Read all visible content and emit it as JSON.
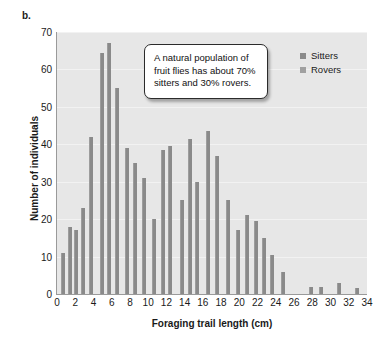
{
  "panel": {
    "label": "b."
  },
  "callout": {
    "text": "A natural population of fruit flies has about 70% sitters and 30% rovers."
  },
  "legend": {
    "position": "top-right",
    "entries": [
      {
        "label": "Sitters",
        "color": "#8a8a8a"
      },
      {
        "label": "Rovers",
        "color": "#a0a0a0"
      }
    ]
  },
  "colors": {
    "bar": "#8a8a8a",
    "plot_background": "#e7e7e7",
    "gridline": "#f2f2f2",
    "axis": "#9a9a9a",
    "text": "#1a1a1a"
  },
  "chart_data": {
    "type": "bar",
    "title": "",
    "subtitle": "",
    "xlabel": "Foraging trail length (cm)",
    "ylabel": "Number of individuals",
    "xlim": [
      0,
      34
    ],
    "ylim": [
      0,
      70
    ],
    "grid": true,
    "xticks": [
      0,
      2,
      4,
      6,
      8,
      10,
      12,
      14,
      16,
      18,
      20,
      22,
      24,
      26,
      28,
      30,
      32,
      34
    ],
    "yticks": [
      0,
      10,
      20,
      30,
      40,
      50,
      60,
      70
    ],
    "xticklabels": [
      "0",
      "2",
      "4",
      "6",
      "8",
      "10",
      "12",
      "14",
      "16",
      "18",
      "20",
      "22",
      "24",
      "26",
      "28",
      "30",
      "32",
      "34"
    ],
    "yticklabels": [
      "0",
      "10",
      "20",
      "30",
      "40",
      "50",
      "60",
      "70"
    ],
    "bar_width": 0.5,
    "x": [
      0.7,
      1.4,
      2.1,
      2.8,
      3.6,
      4.4,
      5.2,
      6.0,
      6.8,
      7.6,
      8.4,
      9.2,
      10.0,
      10.8,
      11.6,
      12.4,
      13.2,
      14.0,
      14.8,
      15.6,
      16.4,
      17.2,
      18.0,
      18.8,
      19.6,
      20.4,
      21.2,
      22.0,
      22.8,
      23.6,
      24.4,
      25.2,
      28.0,
      29.0,
      31.0,
      33.0
    ],
    "values": [
      11,
      18,
      17,
      23,
      42,
      64.5,
      67,
      55,
      39,
      35,
      31,
      20,
      38.5,
      39.5,
      25,
      41.5,
      30,
      43.5,
      37,
      25,
      17,
      21,
      19.5,
      15,
      10.5,
      6,
      0,
      0,
      2,
      2,
      3,
      1.5,
      2,
      2,
      3,
      1.5
    ],
    "bars": [
      {
        "x": 0.7,
        "value": 11
      },
      {
        "x": 1.4,
        "value": 18
      },
      {
        "x": 2.1,
        "value": 17
      },
      {
        "x": 2.9,
        "value": 23
      },
      {
        "x": 3.7,
        "value": 42
      },
      {
        "x": 4.9,
        "value": 64.5
      },
      {
        "x": 5.7,
        "value": 67
      },
      {
        "x": 6.6,
        "value": 55
      },
      {
        "x": 7.7,
        "value": 39
      },
      {
        "x": 8.5,
        "value": 35
      },
      {
        "x": 9.5,
        "value": 31
      },
      {
        "x": 10.6,
        "value": 20
      },
      {
        "x": 11.6,
        "value": 38.5
      },
      {
        "x": 12.4,
        "value": 39.5
      },
      {
        "x": 13.7,
        "value": 25
      },
      {
        "x": 14.6,
        "value": 41.5
      },
      {
        "x": 15.4,
        "value": 30
      },
      {
        "x": 16.6,
        "value": 43.5
      },
      {
        "x": 17.6,
        "value": 37
      },
      {
        "x": 18.7,
        "value": 25
      },
      {
        "x": 19.8,
        "value": 17
      },
      {
        "x": 20.8,
        "value": 21
      },
      {
        "x": 21.8,
        "value": 19.5
      },
      {
        "x": 22.7,
        "value": 15
      },
      {
        "x": 23.6,
        "value": 10.5
      },
      {
        "x": 24.8,
        "value": 6
      },
      {
        "x": 27.9,
        "value": 2
      },
      {
        "x": 28.9,
        "value": 2
      },
      {
        "x": 30.9,
        "value": 3
      },
      {
        "x": 32.9,
        "value": 1.5
      }
    ]
  }
}
